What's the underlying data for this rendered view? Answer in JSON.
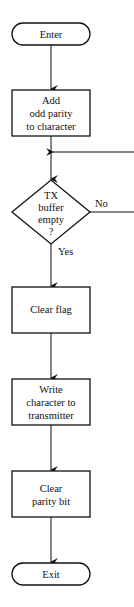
{
  "diagram": {
    "type": "flowchart",
    "nodes": {
      "enter": {
        "shape": "terminator",
        "lines": [
          "Enter"
        ]
      },
      "add_parity": {
        "shape": "process",
        "lines": [
          "Add",
          "odd parity",
          "to character"
        ]
      },
      "tx_check": {
        "shape": "decision",
        "lines": [
          "TX",
          "buffer",
          "empty",
          "?"
        ]
      },
      "clear_flag": {
        "shape": "process",
        "lines": [
          "Clear flag"
        ]
      },
      "write_char": {
        "shape": "process",
        "lines": [
          "Write",
          "character to",
          "transmitter"
        ]
      },
      "clear_parity": {
        "shape": "process",
        "lines": [
          "Clear",
          "parity bit"
        ]
      },
      "exit": {
        "shape": "terminator",
        "lines": [
          "Exit"
        ]
      }
    },
    "edges": {
      "no_label": "No",
      "yes_label": "Yes"
    },
    "colors": {
      "stroke": "#111111",
      "background": "#ffffff"
    }
  }
}
